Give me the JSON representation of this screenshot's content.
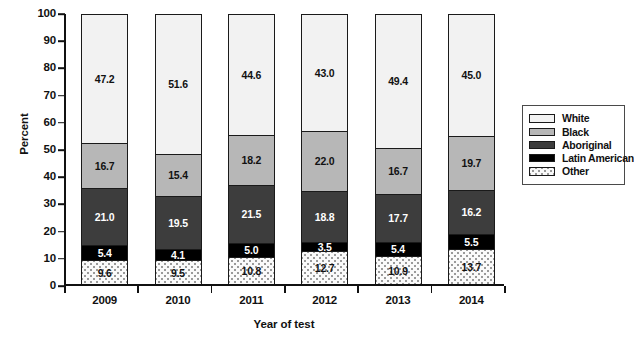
{
  "chart_data": {
    "type": "bar",
    "subtype": "stacked-percent",
    "title": "",
    "xlabel": "Year of test",
    "ylabel": "Percent",
    "ylim": [
      0,
      100
    ],
    "yticks": [
      0,
      10,
      20,
      30,
      40,
      50,
      60,
      70,
      80,
      90,
      100
    ],
    "grid": false,
    "legend_position": "right",
    "categories": [
      "2009",
      "2010",
      "2011",
      "2012",
      "2013",
      "2014"
    ],
    "stack_order_bottom_to_top": [
      "Other",
      "Latin American",
      "Aboriginal",
      "Black",
      "White"
    ],
    "series": [
      {
        "name": "White",
        "values": [
          47.2,
          51.6,
          44.6,
          43.0,
          49.4,
          45.0
        ]
      },
      {
        "name": "Black",
        "values": [
          16.7,
          15.4,
          18.2,
          22.0,
          16.7,
          19.7
        ]
      },
      {
        "name": "Aboriginal",
        "values": [
          21.0,
          19.5,
          21.5,
          18.8,
          17.7,
          16.2
        ]
      },
      {
        "name": "Latin American",
        "values": [
          5.4,
          4.1,
          5.0,
          3.5,
          5.4,
          5.5
        ]
      },
      {
        "name": "Other",
        "values": [
          9.6,
          9.5,
          10.8,
          12.7,
          10.9,
          13.7
        ]
      }
    ]
  },
  "axes": {
    "y_title": "Percent",
    "x_title": "Year of test",
    "y_tick_labels": [
      "100",
      "90",
      "80",
      "70",
      "60",
      "50",
      "40",
      "30",
      "20",
      "10",
      "0"
    ],
    "x_tick_labels": [
      "2009",
      "2010",
      "2011",
      "2012",
      "2013",
      "2014"
    ]
  },
  "legend": {
    "items": [
      {
        "label": "White",
        "swatch": "legend-swatch-white",
        "color": "#f2f2f2"
      },
      {
        "label": "Black",
        "swatch": "legend-swatch-black",
        "color": "#b7b7b7"
      },
      {
        "label": "Aboriginal",
        "swatch": "legend-swatch-aboriginal",
        "color": "#3d3d3d"
      },
      {
        "label": "Latin American",
        "swatch": "legend-swatch-latin-american",
        "color": "#000000"
      },
      {
        "label": "Other",
        "swatch": "legend-swatch-other",
        "color": "#fafafa"
      }
    ]
  },
  "bar_labels": {
    "2009": {
      "White": "47.2",
      "Black": "16.7",
      "Aboriginal": "21.0",
      "Latin American": "5.4",
      "Other": "9.6"
    },
    "2010": {
      "White": "51.6",
      "Black": "15.4",
      "Aboriginal": "19.5",
      "Latin American": "4.1",
      "Other": "9.5"
    },
    "2011": {
      "White": "44.6",
      "Black": "18.2",
      "Aboriginal": "21.5",
      "Latin American": "5.0",
      "Other": "10.8"
    },
    "2012": {
      "White": "43.0",
      "Black": "22.0",
      "Aboriginal": "18.8",
      "Latin American": "3.5",
      "Other": "12.7"
    },
    "2013": {
      "White": "49.4",
      "Black": "16.7",
      "Aboriginal": "17.7",
      "Latin American": "5.4",
      "Other": "10.9"
    },
    "2014": {
      "White": "45.0",
      "Black": "19.7",
      "Aboriginal": "16.2",
      "Latin American": "5.5",
      "Other": "13.7"
    }
  }
}
